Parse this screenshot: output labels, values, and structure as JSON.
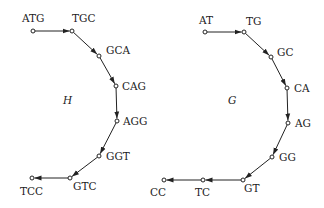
{
  "graphs": [
    {
      "name": "H",
      "name_pos": [
        63,
        104
      ],
      "nodes": [
        {
          "label": "ATG",
          "x": 33,
          "y": 31,
          "lx": 22,
          "ly": 22
        },
        {
          "label": "TGC",
          "x": 72,
          "y": 31,
          "lx": 72,
          "ly": 22
        },
        {
          "label": "GCA",
          "x": 99,
          "y": 56,
          "lx": 106,
          "ly": 54
        },
        {
          "label": "CAG",
          "x": 116,
          "y": 86,
          "lx": 122,
          "ly": 90
        },
        {
          "label": "AGG",
          "x": 117,
          "y": 121,
          "lx": 123,
          "ly": 125
        },
        {
          "label": "GGT",
          "x": 99,
          "y": 156,
          "lx": 106,
          "ly": 160
        },
        {
          "label": "GTC",
          "x": 70,
          "y": 178,
          "lx": 73,
          "ly": 190
        },
        {
          "label": "TCC",
          "x": 32,
          "y": 178,
          "lx": 20,
          "ly": 195
        }
      ],
      "edges": [
        [
          0,
          1
        ],
        [
          1,
          2
        ],
        [
          2,
          3
        ],
        [
          3,
          4
        ],
        [
          4,
          5
        ],
        [
          5,
          6
        ],
        [
          6,
          7
        ]
      ]
    },
    {
      "name": "G",
      "name_pos": [
        228,
        104
      ],
      "nodes": [
        {
          "label": "AT",
          "x": 205,
          "y": 32,
          "lx": 199,
          "ly": 24
        },
        {
          "label": "TG",
          "x": 244,
          "y": 32,
          "lx": 246,
          "ly": 25
        },
        {
          "label": "GC",
          "x": 271,
          "y": 57,
          "lx": 277,
          "ly": 56
        },
        {
          "label": "CA",
          "x": 287,
          "y": 88,
          "lx": 294,
          "ly": 92
        },
        {
          "label": "AG",
          "x": 288,
          "y": 123,
          "lx": 295,
          "ly": 127
        },
        {
          "label": "GG",
          "x": 272,
          "y": 157,
          "lx": 279,
          "ly": 161
        },
        {
          "label": "GT",
          "x": 243,
          "y": 180,
          "lx": 244,
          "ly": 192
        },
        {
          "label": "TC",
          "x": 203,
          "y": 180,
          "lx": 195,
          "ly": 196
        },
        {
          "label": "CC",
          "x": 164,
          "y": 180,
          "lx": 150,
          "ly": 196
        }
      ],
      "edges": [
        [
          0,
          1
        ],
        [
          1,
          2
        ],
        [
          2,
          3
        ],
        [
          3,
          4
        ],
        [
          4,
          5
        ],
        [
          5,
          6
        ],
        [
          6,
          7
        ],
        [
          7,
          8
        ]
      ]
    }
  ]
}
